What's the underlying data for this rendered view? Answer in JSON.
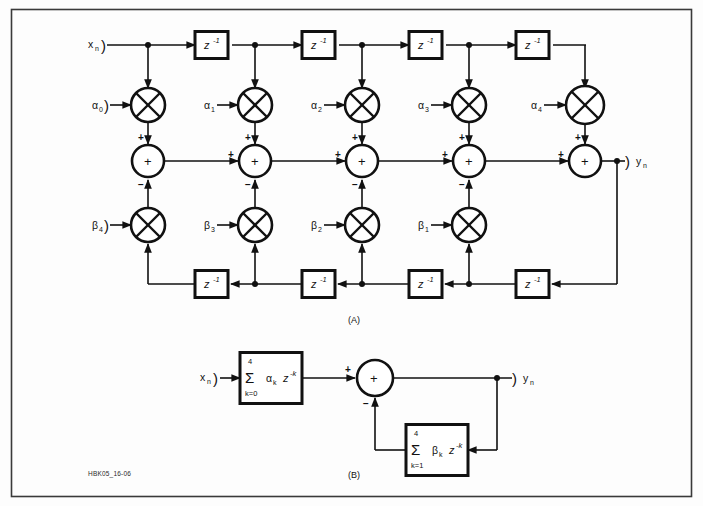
{
  "figure": {
    "id_label": "HBK05_16-06",
    "frame_color": "#3a3a3a",
    "ink_color": "#111111",
    "background": "#fdfdfd",
    "panels": [
      {
        "key": "a",
        "caption": "(A)"
      },
      {
        "key": "b",
        "caption": "(B)"
      }
    ]
  },
  "panel_a": {
    "caption": "(A)",
    "input_label": "x",
    "input_sub": "n",
    "output_label": "y",
    "output_sub": "n",
    "brace": ")",
    "delay_label": "z",
    "delay_exponent": "-1",
    "feedforward_taps": [
      {
        "coef": "α",
        "sub": "0"
      },
      {
        "coef": "α",
        "sub": "1"
      },
      {
        "coef": "α",
        "sub": "2"
      },
      {
        "coef": "α",
        "sub": "3"
      },
      {
        "coef": "α",
        "sub": "4"
      }
    ],
    "feedback_taps": [
      {
        "coef": "β",
        "sub": "4"
      },
      {
        "coef": "β",
        "sub": "3"
      },
      {
        "coef": "β",
        "sub": "2"
      },
      {
        "coef": "β",
        "sub": "1"
      }
    ],
    "top_delay_count": 4,
    "bottom_delay_count": 4,
    "adder_count": 5,
    "adder_symbol": "+",
    "adder_top_sign": "+",
    "adder_left_sign": "+",
    "adder_bottom_sign": "−",
    "multiplier_symbol": "×"
  },
  "panel_b": {
    "caption": "(B)",
    "input_label": "x",
    "input_sub": "n",
    "output_label": "y",
    "output_sub": "n",
    "brace": ")",
    "adder_symbol": "+",
    "adder_left_sign": "+",
    "adder_bottom_sign": "−",
    "forward_block": {
      "upper_limit": "4",
      "sigma": "Σ",
      "lower_limit": "k=0",
      "coef": "α",
      "coef_sub": "k",
      "delay": "z",
      "delay_exponent": "-k"
    },
    "feedback_block": {
      "upper_limit": "4",
      "sigma": "Σ",
      "lower_limit": "k=1",
      "coef": "β",
      "coef_sub": "k",
      "delay": "z",
      "delay_exponent": "-k"
    }
  }
}
